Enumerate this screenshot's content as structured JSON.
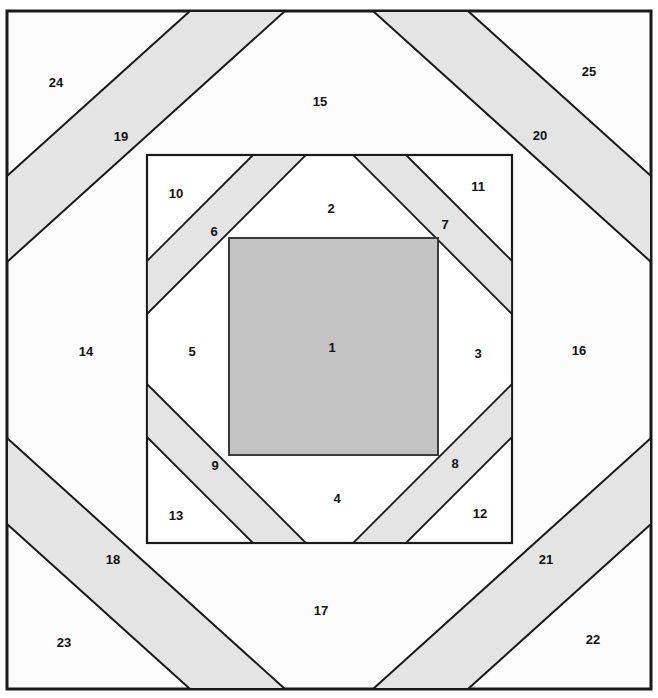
{
  "diagram": {
    "kind": "pineapple-log-cabin-block",
    "canvas": {
      "width": 658,
      "height": 698
    },
    "colors": {
      "background": "#ffffff",
      "plain_fabric": "#fcfcfc",
      "stripe_fabric": "#e4e4e4",
      "center_fabric": "#c3c3c3",
      "outline": "#1a1a1a",
      "label_text": "#111111"
    },
    "frames": {
      "outer_border": {
        "x1": 7,
        "y1": 11,
        "x2": 651,
        "y2": 689
      },
      "middle_square": {
        "x1": 147,
        "y1": 155,
        "x2": 512,
        "y2": 543
      },
      "center_square": {
        "x1": 229,
        "y1": 238,
        "x2": 438,
        "y2": 455
      }
    },
    "piece_count": 25,
    "pieces": [
      {
        "number": "1",
        "label_x": 332,
        "label_y": 349,
        "fabric": "center"
      },
      {
        "number": "2",
        "label_x": 331,
        "label_y": 210,
        "fabric": "plain"
      },
      {
        "number": "3",
        "label_x": 478,
        "label_y": 355,
        "fabric": "plain"
      },
      {
        "number": "4",
        "label_x": 337,
        "label_y": 500,
        "fabric": "plain"
      },
      {
        "number": "5",
        "label_x": 192,
        "label_y": 353,
        "fabric": "plain"
      },
      {
        "number": "6",
        "label_x": 214,
        "label_y": 233,
        "fabric": "stripe"
      },
      {
        "number": "7",
        "label_x": 445,
        "label_y": 226,
        "fabric": "stripe"
      },
      {
        "number": "8",
        "label_x": 455,
        "label_y": 465,
        "fabric": "stripe"
      },
      {
        "number": "9",
        "label_x": 215,
        "label_y": 467,
        "fabric": "stripe"
      },
      {
        "number": "10",
        "label_x": 176,
        "label_y": 195,
        "fabric": "plain"
      },
      {
        "number": "11",
        "label_x": 478,
        "label_y": 188,
        "fabric": "plain"
      },
      {
        "number": "12",
        "label_x": 480,
        "label_y": 515,
        "fabric": "plain"
      },
      {
        "number": "13",
        "label_x": 176,
        "label_y": 517,
        "fabric": "plain"
      },
      {
        "number": "14",
        "label_x": 86,
        "label_y": 353,
        "fabric": "plain"
      },
      {
        "number": "15",
        "label_x": 320,
        "label_y": 103,
        "fabric": "plain"
      },
      {
        "number": "16",
        "label_x": 579,
        "label_y": 352,
        "fabric": "plain"
      },
      {
        "number": "17",
        "label_x": 321,
        "label_y": 612,
        "fabric": "plain"
      },
      {
        "number": "18",
        "label_x": 113,
        "label_y": 561,
        "fabric": "stripe"
      },
      {
        "number": "19",
        "label_x": 121,
        "label_y": 138,
        "fabric": "stripe"
      },
      {
        "number": "20",
        "label_x": 540,
        "label_y": 137,
        "fabric": "stripe"
      },
      {
        "number": "21",
        "label_x": 546,
        "label_y": 561,
        "fabric": "stripe"
      },
      {
        "number": "22",
        "label_x": 593,
        "label_y": 641,
        "fabric": "plain"
      },
      {
        "number": "23",
        "label_x": 64,
        "label_y": 644,
        "fabric": "plain"
      },
      {
        "number": "24",
        "label_x": 56,
        "label_y": 84,
        "fabric": "plain"
      },
      {
        "number": "25",
        "label_x": 589,
        "label_y": 73,
        "fabric": "plain"
      }
    ],
    "outer_ring": {
      "stripes": [
        {
          "name": "stripe-19",
          "points": "7,176 190,11 285,11 7,262"
        },
        {
          "name": "stripe-20",
          "points": "651,176 468,11 373,11 651,262"
        },
        {
          "name": "stripe-18",
          "points": "7,524 190,689 285,689 7,438"
        },
        {
          "name": "stripe-21",
          "points": "651,524 468,689 373,689 651,438"
        }
      ]
    },
    "middle_ring": {
      "stripes": [
        {
          "name": "stripe-6",
          "points": "147,261 253,155 306,155 147,314"
        },
        {
          "name": "stripe-7",
          "points": "512,261 406,155 353,155 512,314"
        },
        {
          "name": "stripe-9",
          "points": "147,437 253,543 306,543 147,384"
        },
        {
          "name": "stripe-8",
          "points": "512,437 406,543 353,543 512,384"
        }
      ]
    }
  }
}
